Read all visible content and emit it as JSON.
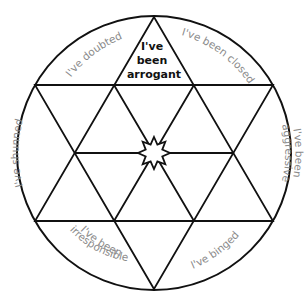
{
  "diagram": {
    "type": "hexagram-in-circle",
    "colors": {
      "stroke": "#111111",
      "label": "#8a8a8a",
      "center_label": "#111111",
      "background": "#ffffff"
    },
    "center_symbol": "8-point-star",
    "top_segment": {
      "lines": [
        "I've",
        "been",
        "arrogant"
      ]
    },
    "outer_labels": {
      "top_left": "I've doubted",
      "top_right": "I've been closed",
      "right_line1": "I've been",
      "right_line2": "aggressive",
      "left": "I've shunned",
      "bottom_left_line1": "I've been",
      "bottom_left_line2": "irresponsible",
      "bottom_right": "I've binged"
    }
  }
}
